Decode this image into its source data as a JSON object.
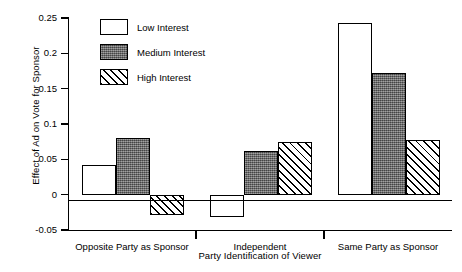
{
  "chart_data": {
    "type": "bar",
    "title": "",
    "xlabel": "Party Identification of Viewer",
    "ylabel": "Effect of Ad on Vote for Sponsor",
    "categories": [
      "Opposite Party as Sponsor",
      "Independent",
      "Same Party as Sponsor"
    ],
    "series": [
      {
        "name": "Low Interest",
        "values": [
          0.042,
          -0.032,
          0.243
        ]
      },
      {
        "name": "Medium Interest",
        "values": [
          0.08,
          0.062,
          0.172
        ]
      },
      {
        "name": "High Interest",
        "values": [
          -0.029,
          0.074,
          0.077
        ]
      }
    ],
    "ylim": [
      -0.05,
      0.25
    ],
    "yticks": [
      0.25,
      0.2,
      0.15,
      0.1,
      0.05,
      0,
      -0.05
    ],
    "ytick_labels": [
      "0.25",
      "0.2",
      "0.15",
      "0.1",
      "0.05",
      "0",
      "-0.05"
    ],
    "grid": false,
    "legend_position": "top-left",
    "zero_reference_line": true
  },
  "legend": {
    "items": [
      {
        "label": "Low Interest",
        "fill": "white"
      },
      {
        "label": "Medium Interest",
        "fill": "dark-gray"
      },
      {
        "label": "High Interest",
        "fill": "diagonal-hatch"
      }
    ]
  },
  "colors": {
    "axis": "#000000",
    "low_interest": "#ffffff",
    "medium_interest": "#6d6d6d",
    "high_interest_hatch": "#000000",
    "background": "#ffffff"
  }
}
